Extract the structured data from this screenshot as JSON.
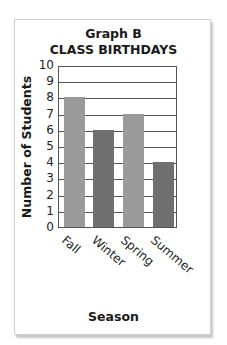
{
  "chart_data": {
    "type": "bar",
    "title": "Graph B",
    "subtitle": "CLASS BIRTHDAYS",
    "categories": [
      "Fall",
      "Winter",
      "Spring",
      "Summer"
    ],
    "values": [
      8,
      6,
      7,
      4
    ],
    "xlabel": "Season",
    "ylabel": "Number of Students",
    "ylim": [
      0,
      10
    ],
    "yticks": [
      "0",
      "1",
      "2",
      "3",
      "4",
      "5",
      "6",
      "7",
      "8",
      "9",
      "10"
    ],
    "grid": true,
    "legend": null,
    "bar_colors": [
      "#9a9a9a",
      "#6f6f6f",
      "#9a9a9a",
      "#6f6f6f"
    ]
  }
}
